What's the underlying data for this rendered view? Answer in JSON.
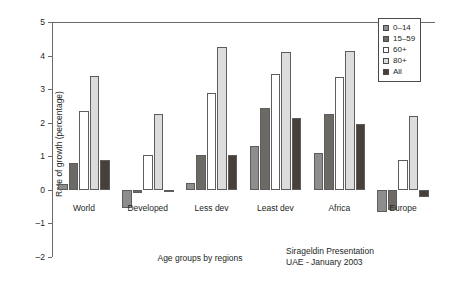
{
  "chart_data": {
    "type": "bar",
    "title": "",
    "xlabel": "Age groups by regions",
    "ylabel": "Rate of growth (percentage)",
    "categories": [
      "World",
      "Developed",
      "Less dev",
      "Least dev",
      "Africa",
      "Europe"
    ],
    "series": [
      {
        "name": "0–14",
        "color": "#8d8d8d",
        "values": [
          0.18,
          -0.55,
          0.2,
          1.3,
          1.1,
          -0.65
        ]
      },
      {
        "name": "15–59",
        "color": "#6d6a66",
        "values": [
          0.8,
          -0.1,
          1.05,
          2.45,
          2.25,
          -0.6
        ]
      },
      {
        "name": "60+",
        "color": "#ffffff",
        "values": [
          2.35,
          1.05,
          2.9,
          3.45,
          3.35,
          0.9
        ]
      },
      {
        "name": "80+",
        "color": "#dcdcdc",
        "values": [
          3.4,
          2.25,
          4.25,
          4.1,
          4.15,
          2.2
        ]
      },
      {
        "name": "All",
        "color": "#47403a",
        "values": [
          0.9,
          -0.05,
          1.05,
          2.15,
          1.95,
          -0.2
        ]
      }
    ],
    "ylim": [
      -2,
      5
    ],
    "yticks": [
      5,
      4,
      3,
      2,
      1,
      0,
      -1,
      -2
    ],
    "ytick_labels": [
      "5",
      "4",
      "3",
      "2",
      "1",
      "0",
      "–1",
      "–2"
    ],
    "grid": false,
    "legend_position": "top-right",
    "legend_entries": [
      "0–14",
      "15–59",
      "60+",
      "80+",
      "All"
    ]
  },
  "captions": {
    "x_axis": "Age groups by regions",
    "credit_line1": "Sirageldin Presentation",
    "credit_line2": "UAE - January 2003"
  }
}
